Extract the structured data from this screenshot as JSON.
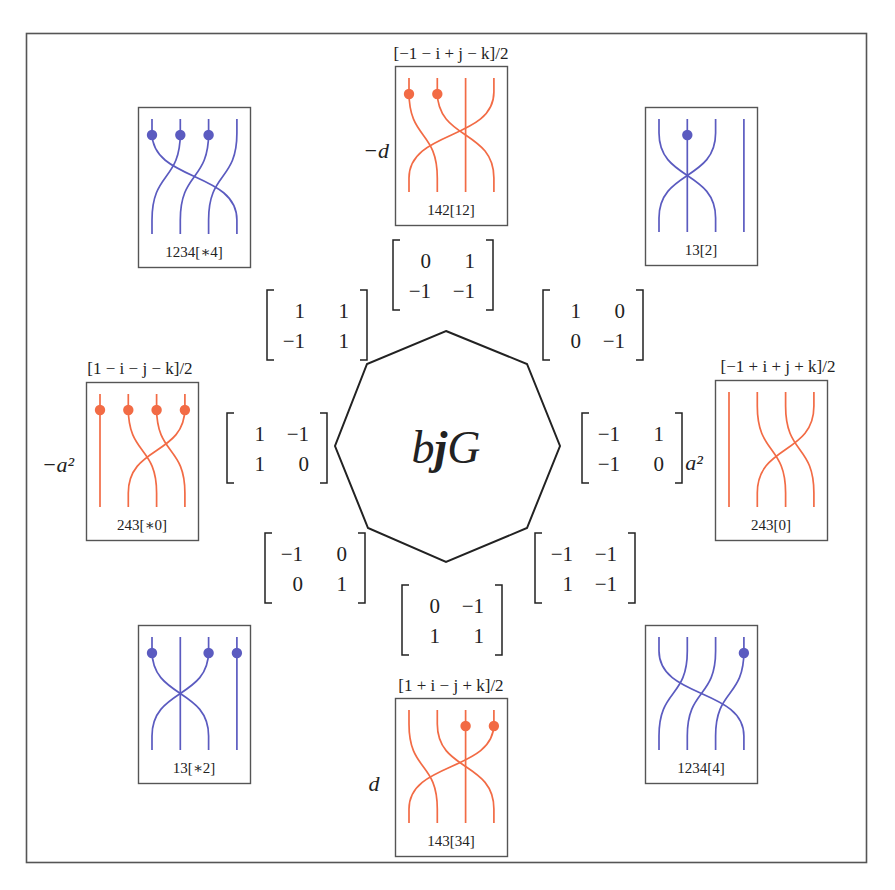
{
  "diagram": {
    "title": "bjG",
    "center_label": {
      "b": "b",
      "j": "j",
      "G": "G"
    },
    "colors": {
      "blue": "#5b5bc0",
      "orange": "#f26b45",
      "frame": "#555555",
      "text": "#222222"
    },
    "boxes": [
      {
        "id": "top",
        "caption": "142[12]",
        "quaternion": "[−1 − i + j − k]/2",
        "coefficient": "−d",
        "color": "orange",
        "perm": [
          1,
          3,
          2,
          0
        ],
        "dots": [
          0,
          1
        ]
      },
      {
        "id": "top-left",
        "caption": "1234[∗4]",
        "quaternion": "",
        "coefficient": "",
        "color": "blue",
        "perm": [
          3,
          0,
          1,
          2
        ],
        "dots": [
          0,
          1,
          2
        ]
      },
      {
        "id": "top-right",
        "caption": "13[2]",
        "quaternion": "",
        "coefficient": "",
        "color": "blue",
        "perm": [
          2,
          1,
          0,
          3
        ],
        "dots": [
          1
        ]
      },
      {
        "id": "left",
        "caption": "243[∗0]",
        "quaternion": "[1 − i − j − k]/2",
        "coefficient": "−a²",
        "color": "orange",
        "perm": [
          0,
          2,
          3,
          1
        ],
        "dots": [
          0,
          1,
          2,
          3
        ]
      },
      {
        "id": "right",
        "caption": "243[0]",
        "quaternion": "[−1 + i + j + k]/2",
        "coefficient": "a²",
        "color": "orange",
        "perm": [
          0,
          2,
          3,
          1
        ],
        "dots": []
      },
      {
        "id": "bottom-left",
        "caption": "13[∗2]",
        "quaternion": "",
        "coefficient": "",
        "color": "blue",
        "perm": [
          2,
          1,
          0,
          3
        ],
        "dots": [
          0,
          2,
          3
        ]
      },
      {
        "id": "bottom",
        "caption": "143[34]",
        "quaternion": "[1 + i − j + k]/2",
        "coefficient": "d",
        "color": "orange",
        "perm": [
          1,
          3,
          2,
          0
        ],
        "dots": [
          2,
          3
        ]
      },
      {
        "id": "bottom-right",
        "caption": "1234[4]",
        "quaternion": "",
        "coefficient": "",
        "color": "blue",
        "perm": [
          3,
          0,
          1,
          2
        ],
        "dots": [
          3
        ]
      }
    ],
    "matrices": [
      {
        "id": "m-top",
        "rows": [
          [
            "0",
            "1"
          ],
          [
            "−1",
            "−1"
          ]
        ]
      },
      {
        "id": "m-top-left",
        "rows": [
          [
            "1",
            "1"
          ],
          [
            "−1",
            "1"
          ]
        ]
      },
      {
        "id": "m-top-right",
        "rows": [
          [
            "1",
            "0"
          ],
          [
            "0",
            "−1"
          ]
        ]
      },
      {
        "id": "m-left",
        "rows": [
          [
            "1",
            "−1"
          ],
          [
            "1",
            "0"
          ]
        ]
      },
      {
        "id": "m-right",
        "rows": [
          [
            "−1",
            "1"
          ],
          [
            "−1",
            "0"
          ]
        ]
      },
      {
        "id": "m-bottom-left",
        "rows": [
          [
            "−1",
            "0"
          ],
          [
            "0",
            "1"
          ]
        ]
      },
      {
        "id": "m-bottom-right",
        "rows": [
          [
            "−1",
            "−1"
          ],
          [
            "1",
            "−1"
          ]
        ]
      },
      {
        "id": "m-bottom",
        "rows": [
          [
            "0",
            "−1"
          ],
          [
            "1",
            "1"
          ]
        ]
      }
    ]
  }
}
